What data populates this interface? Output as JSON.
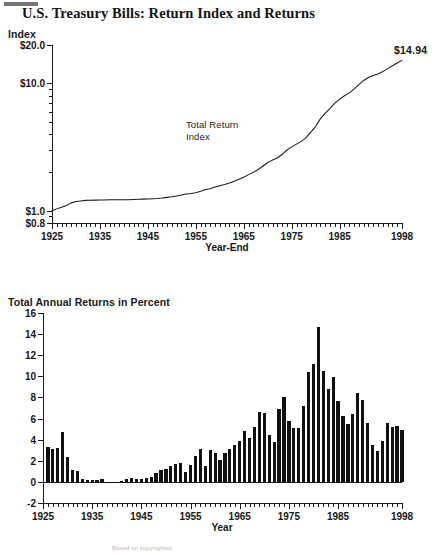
{
  "figure": {
    "title": "U.S. Treasury Bills: Return Index and Returns",
    "footnote": "Based on copyrighted"
  },
  "chart_data": [
    {
      "type": "line",
      "title": "Index",
      "xlabel": "Year-End",
      "ylabel": "Index",
      "yscale": "log",
      "ylim": [
        0.8,
        20.0
      ],
      "ytick_labels": [
        "$20.0",
        "$10.0",
        "$1.0",
        "$0.8"
      ],
      "ytick_values": [
        20.0,
        10.0,
        1.0,
        0.8
      ],
      "xlim": [
        1925,
        1998
      ],
      "xtick_labels": [
        "1925",
        "1935",
        "1945",
        "1955",
        "1965",
        "1975",
        "1985",
        "1998"
      ],
      "xtick_values": [
        1925,
        1935,
        1945,
        1955,
        1965,
        1975,
        1985,
        1998
      ],
      "grid": false,
      "legend": "none",
      "annotations": [
        {
          "text": "Total Return\nIndex",
          "x": 1958,
          "y": 3.6
        },
        {
          "text": "$14.94",
          "x": 1998,
          "y": 14.94
        }
      ],
      "series": [
        {
          "name": "Total Return Index",
          "x": [
            1925,
            1926,
            1927,
            1928,
            1929,
            1930,
            1931,
            1932,
            1933,
            1934,
            1935,
            1936,
            1937,
            1938,
            1939,
            1940,
            1941,
            1942,
            1943,
            1944,
            1945,
            1946,
            1947,
            1948,
            1949,
            1950,
            1951,
            1952,
            1953,
            1954,
            1955,
            1956,
            1957,
            1958,
            1959,
            1960,
            1961,
            1962,
            1963,
            1964,
            1965,
            1966,
            1967,
            1968,
            1969,
            1970,
            1971,
            1972,
            1973,
            1974,
            1975,
            1976,
            1977,
            1978,
            1979,
            1980,
            1981,
            1982,
            1983,
            1984,
            1985,
            1986,
            1987,
            1988,
            1989,
            1990,
            1991,
            1992,
            1993,
            1994,
            1995,
            1996,
            1997,
            1998
          ],
          "values": [
            1.0,
            1.033,
            1.065,
            1.099,
            1.151,
            1.179,
            1.192,
            1.204,
            1.208,
            1.21,
            1.212,
            1.214,
            1.218,
            1.218,
            1.218,
            1.218,
            1.219,
            1.223,
            1.228,
            1.232,
            1.236,
            1.241,
            1.247,
            1.257,
            1.272,
            1.287,
            1.306,
            1.328,
            1.352,
            1.364,
            1.385,
            1.42,
            1.464,
            1.487,
            1.531,
            1.572,
            1.606,
            1.65,
            1.702,
            1.762,
            1.831,
            1.919,
            2.0,
            2.105,
            2.243,
            2.39,
            2.495,
            2.59,
            2.772,
            2.995,
            3.168,
            3.329,
            3.499,
            3.751,
            4.144,
            4.597,
            5.28,
            5.838,
            6.348,
            6.982,
            7.521,
            7.983,
            8.422,
            9.017,
            9.776,
            10.534,
            11.115,
            11.504,
            11.849,
            12.367,
            13.056,
            13.725,
            14.44,
            15.137
          ]
        }
      ]
    },
    {
      "type": "bar",
      "title": "Total Annual Returns in Percent",
      "xlabel": "Year",
      "ylabel": "",
      "ylim": [
        -2,
        16
      ],
      "ytick_labels": [
        "-2",
        "0",
        "2",
        "4",
        "6",
        "8",
        "10",
        "12",
        "14",
        "16"
      ],
      "ytick_values": [
        -2,
        0,
        2,
        4,
        6,
        8,
        10,
        12,
        14,
        16
      ],
      "xlim": [
        1925,
        1998
      ],
      "xtick_labels": [
        "1925",
        "1935",
        "1945",
        "1955",
        "1965",
        "1975",
        "1985",
        "1998"
      ],
      "xtick_values": [
        1925,
        1935,
        1945,
        1955,
        1965,
        1975,
        1985,
        1998
      ],
      "grid": false,
      "legend": "none",
      "categories": [
        1926,
        1927,
        1928,
        1929,
        1930,
        1931,
        1932,
        1933,
        1934,
        1935,
        1936,
        1937,
        1938,
        1939,
        1940,
        1941,
        1942,
        1943,
        1944,
        1945,
        1946,
        1947,
        1948,
        1949,
        1950,
        1951,
        1952,
        1953,
        1954,
        1955,
        1956,
        1957,
        1958,
        1959,
        1960,
        1961,
        1962,
        1963,
        1964,
        1965,
        1966,
        1967,
        1968,
        1969,
        1970,
        1971,
        1972,
        1973,
        1974,
        1975,
        1976,
        1977,
        1978,
        1979,
        1980,
        1981,
        1982,
        1983,
        1984,
        1985,
        1986,
        1987,
        1988,
        1989,
        1990,
        1991,
        1992,
        1993,
        1994,
        1995,
        1996,
        1997,
        1998
      ],
      "values": [
        3.3,
        3.1,
        3.2,
        4.7,
        2.4,
        1.1,
        1.0,
        0.3,
        0.2,
        0.2,
        0.2,
        0.3,
        0.0,
        0.0,
        0.0,
        0.1,
        0.3,
        0.4,
        0.3,
        0.3,
        0.4,
        0.5,
        0.8,
        1.1,
        1.2,
        1.5,
        1.7,
        1.8,
        0.9,
        1.6,
        2.5,
        3.1,
        1.5,
        3.0,
        2.7,
        2.1,
        2.7,
        3.1,
        3.5,
        3.9,
        4.8,
        4.2,
        5.2,
        6.6,
        6.5,
        4.4,
        3.8,
        6.9,
        8.0,
        5.8,
        5.1,
        5.1,
        7.2,
        10.4,
        11.2,
        14.7,
        10.5,
        8.8,
        9.9,
        7.7,
        6.2,
        5.5,
        6.4,
        8.4,
        7.8,
        5.6,
        3.5,
        2.9,
        3.9,
        5.6,
        5.2,
        5.3,
        4.9
      ]
    }
  ]
}
